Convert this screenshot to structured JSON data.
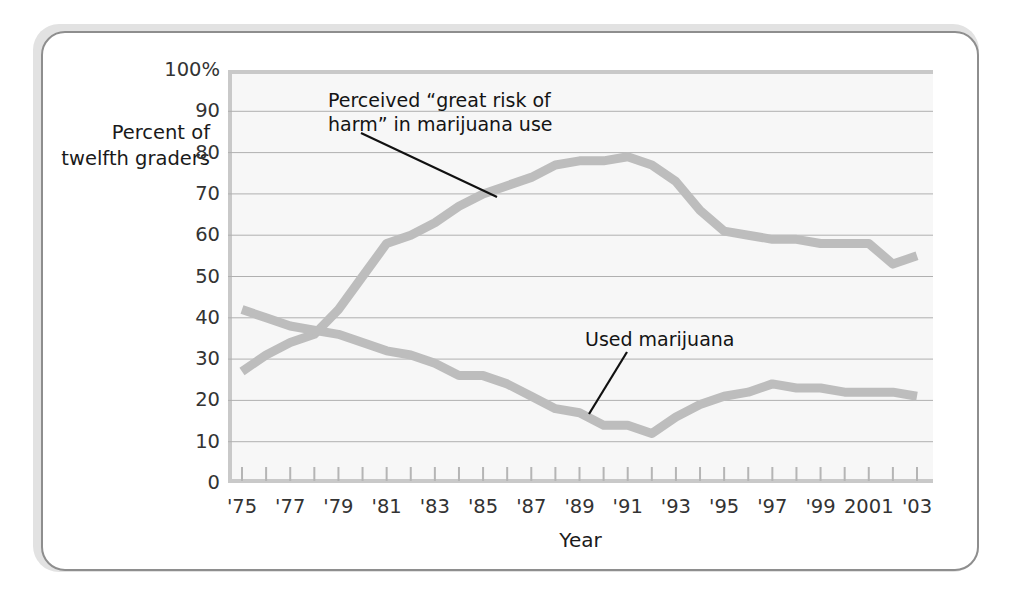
{
  "figure": {
    "y_axis_title": "Percent\nof\ntwelfth\ngraders",
    "x_axis_title": "Year",
    "frame_border_color": "#8e8e8e",
    "plot_background_color": "#f7f7f7",
    "gridline_color": "#b0b0b0",
    "series_color": "#bdbdbd",
    "annotation_line_color": "#111111"
  },
  "annotations": {
    "risk": "Perceived “great risk of\nharm” in marijuana use",
    "used": "Used marijuana"
  },
  "chart_data": {
    "type": "line",
    "title": "",
    "xlabel": "Year",
    "ylabel": "Percent of twelfth graders",
    "xlim": [
      1975,
      2003
    ],
    "ylim": [
      0,
      100
    ],
    "ytick_values": [
      0,
      10,
      20,
      30,
      40,
      50,
      60,
      70,
      80,
      90,
      100
    ],
    "ytick_labels": [
      "0",
      "10",
      "20",
      "30",
      "40",
      "50",
      "60",
      "70",
      "80",
      "90",
      "100%"
    ],
    "xtick_values": [
      1975,
      1976,
      1977,
      1978,
      1979,
      1980,
      1981,
      1982,
      1983,
      1984,
      1985,
      1986,
      1987,
      1988,
      1989,
      1990,
      1991,
      1992,
      1993,
      1994,
      1995,
      1996,
      1997,
      1998,
      1999,
      2000,
      2001,
      2002,
      2003
    ],
    "xtick_labels_shown": [
      "'75",
      "'77",
      "'79",
      "'81",
      "'83",
      "'85",
      "'87",
      "'89",
      "'91",
      "'93",
      "'95",
      "'97",
      "'99",
      "2001",
      "'03"
    ],
    "xtick_labels_shown_values": [
      1975,
      1977,
      1979,
      1981,
      1983,
      1985,
      1987,
      1989,
      1991,
      1993,
      1995,
      1997,
      1999,
      2001,
      2003
    ],
    "grid": "horizontal",
    "legend": "none (inline annotations)",
    "x": [
      1975,
      1976,
      1977,
      1978,
      1979,
      1980,
      1981,
      1982,
      1983,
      1984,
      1985,
      1986,
      1987,
      1988,
      1989,
      1990,
      1991,
      1992,
      1993,
      1994,
      1995,
      1996,
      1997,
      1998,
      1999,
      2000,
      2001,
      2002,
      2003
    ],
    "series": [
      {
        "name": "Perceived “great risk of harm” in marijuana use",
        "values": [
          27,
          31,
          34,
          36,
          42,
          50,
          58,
          60,
          63,
          67,
          70,
          72,
          74,
          77,
          78,
          78,
          79,
          77,
          73,
          66,
          61,
          60,
          59,
          59,
          58,
          58,
          58,
          53,
          55
        ]
      },
      {
        "name": "Used marijuana",
        "values": [
          42,
          40,
          38,
          37,
          36,
          34,
          32,
          31,
          29,
          26,
          26,
          24,
          21,
          18,
          17,
          14,
          14,
          12,
          16,
          19,
          21,
          22,
          24,
          23,
          23,
          22,
          22,
          22,
          21
        ]
      }
    ]
  }
}
